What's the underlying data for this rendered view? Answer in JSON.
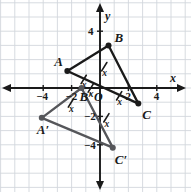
{
  "figure": {
    "background_color": "#ffffff",
    "grid_color": "#d2d7dd",
    "axis_color": "#1a1a1a",
    "preimage_color": "#1a1a1a",
    "image_color": "#55565a",
    "axes": {
      "x_label": "x",
      "y_label": "y",
      "origin_label": "O",
      "x_ticks": [
        {
          "value": -4,
          "label": "−4"
        },
        {
          "value": -2,
          "label": "−2"
        },
        {
          "value": 2,
          "label": "2"
        },
        {
          "value": 4,
          "label": "4"
        }
      ],
      "y_ticks": [
        {
          "value": 4,
          "label": "4"
        },
        {
          "value": -2,
          "label": "−2"
        },
        {
          "value": -4,
          "label": "−4"
        }
      ],
      "x_range": [
        -6,
        6
      ],
      "y_range": [
        -6,
        6
      ],
      "grid": true,
      "grid_step": 1
    }
  },
  "chart_data": {
    "type": "scatter",
    "xlabel": "x",
    "ylabel": "y",
    "xlim": [
      -6,
      6
    ],
    "ylim": [
      -6,
      6
    ],
    "grid": true,
    "legend": "none",
    "series": [
      {
        "name": "Triangle ABC (preimage)",
        "color": "#1a1a1a",
        "closed": true,
        "points": [
          {
            "label": "A",
            "x": -2.3,
            "y": 1.2
          },
          {
            "label": "B",
            "x": 0.6,
            "y": 3.0
          },
          {
            "label": "C",
            "x": 2.7,
            "y": -1.1
          }
        ]
      },
      {
        "name": "Triangle A′B′C′ (image)",
        "color": "#55565a",
        "closed": true,
        "points": [
          {
            "label": "A′",
            "x": -4.1,
            "y": -2.1
          },
          {
            "label": "B′",
            "x": -1.3,
            "y": 0.0
          },
          {
            "label": "C′",
            "x": 0.9,
            "y": -4.2
          }
        ]
      }
    ],
    "annotations": [
      {
        "kind": "congruence-tick",
        "label": "x",
        "on": "segment OA",
        "x": -1.15,
        "y": 0.6
      },
      {
        "kind": "congruence-tick",
        "label": "x",
        "on": "segment OB",
        "x": 0.3,
        "y": 1.5
      },
      {
        "kind": "congruence-tick",
        "label": "x",
        "on": "segment OC",
        "x": 1.35,
        "y": -0.55
      },
      {
        "kind": "congruence-tick",
        "label": "x",
        "on": "segment OA′",
        "x": -2.05,
        "y": -1.05
      },
      {
        "kind": "congruence-tick",
        "label": "x",
        "on": "segment OB′",
        "x": -0.65,
        "y": 0.0
      },
      {
        "kind": "congruence-tick",
        "label": "x",
        "on": "segment OC′",
        "x": 0.45,
        "y": -2.1
      }
    ]
  },
  "labels": {
    "A": "A",
    "B": "B",
    "C": "C",
    "A_prime": "A′",
    "B_prime": "B′",
    "C_prime": "C′",
    "tick_mark": "x",
    "origin": "O",
    "axis_x": "x",
    "axis_y": "y",
    "x_neg4": "−4",
    "x_neg2": "−2",
    "x_pos2": "2",
    "x_pos4": "4",
    "y_pos4": "4",
    "y_neg2": "−2",
    "y_neg4": "−4"
  }
}
